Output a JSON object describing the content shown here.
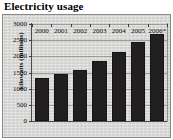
{
  "chart_data": {
    "type": "bar",
    "title": "Electricity usage",
    "xlabel": "",
    "ylabel": "kilowatts (millions)",
    "categories": [
      "2000",
      "2001",
      "2002",
      "2003",
      "2004",
      "2005",
      "2006*"
    ],
    "values": [
      1330,
      1440,
      1590,
      1870,
      2140,
      2430,
      2700
    ],
    "ylim": [
      0,
      3000
    ],
    "yticks": [
      0,
      500,
      1000,
      1500,
      2000,
      2500,
      3000
    ],
    "ytick_labels": [
      "0",
      "500",
      "1000",
      "1500",
      "2000",
      "2500",
      "3000"
    ],
    "grid": true,
    "legend": false,
    "legend_position": "none",
    "series": [
      {
        "name": "kilowatts (millions)",
        "values": [
          1330,
          1440,
          1590,
          1870,
          2140,
          2430,
          2700
        ],
        "color": "#211f1f"
      }
    ],
    "colors": {
      "bar": "#211f1f",
      "panel_background": "#d8d8d6",
      "gridline": "#9b9b99",
      "axis": "#4a4a4a",
      "text": "#0d0d0d",
      "frame": "#8a8a8a"
    },
    "footnote": "*"
  }
}
